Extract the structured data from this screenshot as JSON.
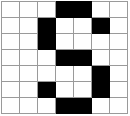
{
  "figure": {
    "name": "grid-pattern",
    "rows": 7,
    "columns": 7,
    "colors": {
      "filled": "#000000",
      "empty": "#ffffff",
      "gridline": "#9a9a9a",
      "border": "#8a8a8a"
    },
    "cells": [
      [
        "empty",
        "empty",
        "empty",
        "filled",
        "filled",
        "empty",
        "empty"
      ],
      [
        "empty",
        "empty",
        "filled",
        "empty",
        "empty",
        "filled",
        "empty"
      ],
      [
        "empty",
        "empty",
        "filled",
        "empty",
        "empty",
        "empty",
        "empty"
      ],
      [
        "empty",
        "empty",
        "empty",
        "filled",
        "filled",
        "empty",
        "empty"
      ],
      [
        "empty",
        "empty",
        "empty",
        "empty",
        "empty",
        "filled",
        "empty"
      ],
      [
        "empty",
        "empty",
        "filled",
        "empty",
        "empty",
        "filled",
        "empty"
      ],
      [
        "empty",
        "empty",
        "empty",
        "filled",
        "filled",
        "empty",
        "empty"
      ]
    ]
  }
}
